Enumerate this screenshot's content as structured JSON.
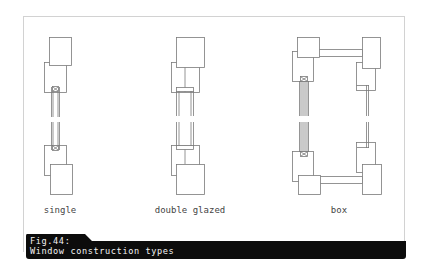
{
  "figure": {
    "number_label": "Fig.44:",
    "title": "Window construction types"
  },
  "diagrams": [
    {
      "id": "single",
      "label": "single",
      "label_x": 60,
      "label_y": 205
    },
    {
      "id": "double-glazed",
      "label": "double glazed",
      "label_x": 190,
      "label_y": 205
    },
    {
      "id": "box",
      "label": "box",
      "label_x": 339,
      "label_y": 205
    }
  ],
  "colors": {
    "line": "#7a7a7a",
    "fill": "#ffffff",
    "caption_bg": "#0c0c0c",
    "caption_text": "#f2f2f2",
    "frame": "#d2d2d2"
  }
}
